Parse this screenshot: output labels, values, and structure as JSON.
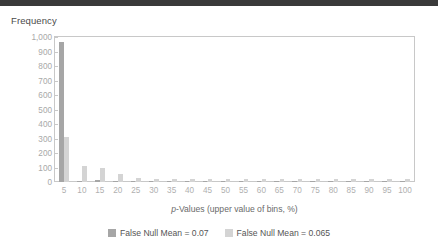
{
  "top_band_color": "#3a3a3a",
  "axis": {
    "y_title": "Frequency",
    "x_title_prefix": "p",
    "x_title_rest": "-Values (upper value of bins, %)"
  },
  "legend": {
    "position": "bottom-center",
    "items": [
      {
        "label": "False Null Mean = 0.07",
        "color": "#a6a6a6"
      },
      {
        "label": "False Null Mean = 0.065",
        "color": "#d4d4d4"
      }
    ]
  },
  "chart_data": {
    "type": "bar",
    "title": "",
    "subtitle": "",
    "xlabel": "p-Values (upper value of bins, %)",
    "ylabel": "Frequency",
    "grid": false,
    "legend_position": "bottom-center",
    "categories": [
      "5",
      "10",
      "15",
      "20",
      "25",
      "30",
      "35",
      "40",
      "45",
      "50",
      "55",
      "60",
      "65",
      "70",
      "75",
      "80",
      "85",
      "90",
      "95",
      "100"
    ],
    "xtick_labels": [
      "5",
      "10",
      "15",
      "20",
      "25",
      "30",
      "35",
      "40",
      "45",
      "50",
      "55",
      "60",
      "65",
      "70",
      "75",
      "80",
      "85",
      "90",
      "95",
      "100"
    ],
    "ytick_labels": [
      "0",
      "100",
      "200",
      "300",
      "400",
      "500",
      "600",
      "700",
      "800",
      "900",
      "1,000"
    ],
    "ylim": [
      0,
      1000
    ],
    "ytick_step": 100,
    "series": [
      {
        "name": "False Null Mean = 0.07",
        "color": "#a6a6a6",
        "values": [
          965,
          5,
          15,
          5,
          5,
          5,
          5,
          5,
          5,
          5,
          5,
          5,
          5,
          5,
          5,
          5,
          5,
          5,
          5,
          5
        ]
      },
      {
        "name": "False Null Mean = 0.065",
        "color": "#d4d4d4",
        "values": [
          310,
          110,
          100,
          55,
          30,
          22,
          22,
          22,
          22,
          20,
          20,
          20,
          22,
          18,
          18,
          22,
          18,
          18,
          22,
          18
        ]
      }
    ]
  }
}
